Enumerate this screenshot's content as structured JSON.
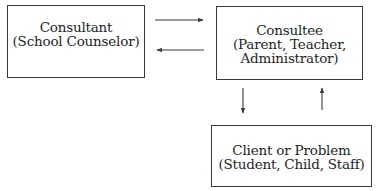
{
  "diagram": {
    "type": "consultation-triadic-model",
    "nodes": [
      {
        "id": "consultant",
        "title": "Consultant",
        "subtitle": "(School Counselor)"
      },
      {
        "id": "consultee",
        "title": "Consultee",
        "subtitle_line1": "(Parent, Teacher,",
        "subtitle_line2": "Administrator)"
      },
      {
        "id": "client",
        "title": "Client or Problem",
        "subtitle": "(Student, Child, Staff)"
      }
    ],
    "edges": [
      {
        "from": "consultant",
        "to": "consultee",
        "direction": "right"
      },
      {
        "from": "consultee",
        "to": "consultant",
        "direction": "left"
      },
      {
        "from": "consultee",
        "to": "client",
        "direction": "down"
      },
      {
        "from": "client",
        "to": "consultee",
        "direction": "up"
      }
    ],
    "colors": {
      "line": "#3a3a3a",
      "text": "#1e1e1e",
      "background": "#ffffff"
    }
  }
}
